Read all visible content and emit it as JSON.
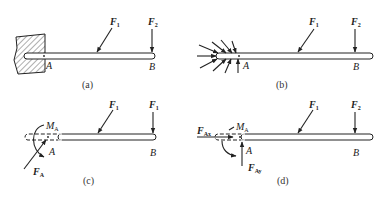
{
  "figure": {
    "panels": [
      {
        "id": "a",
        "caption": "(a)",
        "support": "fixed wall (hatched)",
        "labels": {
          "point_a": "A",
          "point_b": "B",
          "force1": "F",
          "force1_sub": "1",
          "force2": "F",
          "force2_sub": "2"
        }
      },
      {
        "id": "b",
        "caption": "(b)",
        "support": "distributed reaction arrows",
        "labels": {
          "point_a": "A",
          "point_b": "B",
          "force1": "F",
          "force1_sub": "1",
          "force2": "F",
          "force2_sub": "2"
        }
      },
      {
        "id": "c",
        "caption": "(c)",
        "support": "resultant force and moment",
        "labels": {
          "point_a": "A",
          "point_b": "B",
          "force1": "F",
          "force1_sub": "1",
          "force2": "F",
          "force2_sub": "1",
          "moment": "M",
          "moment_sub": "A",
          "reaction": "F",
          "reaction_sub": "A"
        }
      },
      {
        "id": "d",
        "caption": "(d)",
        "support": "reaction components",
        "labels": {
          "point_a": "A",
          "point_b": "B",
          "force1": "F",
          "force1_sub": "1",
          "force2": "F",
          "force2_sub": "2",
          "moment": "M",
          "moment_sub": "A",
          "reaction_x": "F",
          "reaction_x_sub": "Ax",
          "reaction_y": "F",
          "reaction_y_sub": "Ay"
        }
      }
    ]
  },
  "colors": {
    "stroke": "#222222",
    "background": "#ffffff"
  }
}
